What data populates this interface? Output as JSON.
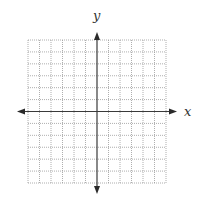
{
  "figure": {
    "x_axis_label": "x",
    "y_axis_label": "y",
    "grid": {
      "columns": 12,
      "rows": 12,
      "columns_left_of_y_axis": 6,
      "rows_above_x_axis": 6,
      "line_style": "dotted"
    },
    "axes": {
      "x_axis_arrows": [
        "left",
        "right"
      ],
      "y_axis_arrows": [
        "up",
        "down"
      ]
    },
    "colors": {
      "grid": "#9a9a9a",
      "axis": "#3a3a3a",
      "label": "#333333",
      "background": "#ffffff"
    }
  }
}
